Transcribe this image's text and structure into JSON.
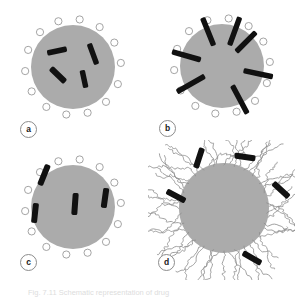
{
  "figure": {
    "type": "scientific-schematic",
    "layout": "2x2-grid",
    "width": 295,
    "height": 297,
    "background": "#ffffff",
    "caption": "Fig. 7.11   Schematic representation of drug",
    "caption_label": "Fig. 7.11",
    "colors": {
      "particle_fill": "#ababab",
      "particle_stroke": "none",
      "rod_fill": "#111111",
      "receptor_fill": "#ffffff",
      "receptor_stroke": "#9a9a9a",
      "polymer_stroke": "#8f8f8f",
      "label_text": "#1a1a1a",
      "label_border": "#8c8c8c"
    }
  },
  "panels": [
    {
      "id": "a",
      "label": "a",
      "name": "panel-a-drug-encapsulated",
      "description": "Spherical particle with surface receptor rings and drug rods randomly dispersed inside the core",
      "circle": {
        "cx": 73,
        "cy": 67,
        "r": 42
      },
      "receptor_count": 14,
      "receptor_radius": 3.6,
      "receptor_ring_radius": 48,
      "receptor_start_angle": -82,
      "rod_count": 4,
      "rods": [
        {
          "x": 57,
          "y": 51,
          "len": 20,
          "w": 5.5,
          "angle": -12
        },
        {
          "x": 93,
          "y": 54,
          "len": 22,
          "w": 5.5,
          "angle": 70
        },
        {
          "x": 58,
          "y": 75,
          "len": 20,
          "w": 6,
          "angle": 44
        },
        {
          "x": 84,
          "y": 79,
          "len": 18,
          "w": 5.5,
          "angle": 78
        }
      ]
    },
    {
      "id": "b",
      "label": "b",
      "name": "panel-b-drug-membrane-inserted",
      "description": "Particle with drug rods inserted radially through the surface, spanning the membrane boundary",
      "circle": {
        "cx": 222,
        "cy": 66,
        "r": 42
      },
      "receptor_count": 14,
      "receptor_radius": 3.6,
      "receptor_ring_radius": 48,
      "receptor_start_angle": -82,
      "rod_count": 7,
      "rods": [
        {
          "angle": 248,
          "inner": 22,
          "outer": 52,
          "w": 5.5
        },
        {
          "angle": 290,
          "inner": 22,
          "outer": 52,
          "w": 5.5
        },
        {
          "angle": 315,
          "inner": 20,
          "outer": 48,
          "w": 5.5
        },
        {
          "angle": 12,
          "inner": 22,
          "outer": 52,
          "w": 5.5
        },
        {
          "angle": 62,
          "inner": 22,
          "outer": 54,
          "w": 5.5
        },
        {
          "angle": 150,
          "inner": 20,
          "outer": 52,
          "w": 5.5
        },
        {
          "angle": 196,
          "inner": 22,
          "outer": 52,
          "w": 5.5
        }
      ]
    },
    {
      "id": "c",
      "label": "c",
      "name": "panel-c-drug-oriented-radial",
      "description": "Particle with fewer drug rods aligned near-vertically inside the core and one crossing the surface",
      "circle": {
        "cx": 73,
        "cy": 207,
        "r": 42
      },
      "receptor_count": 14,
      "receptor_radius": 3.6,
      "receptor_ring_radius": 48,
      "receptor_start_angle": -82,
      "rod_count": 4,
      "rods": [
        {
          "x": 44,
          "y": 175,
          "len": 22,
          "w": 6,
          "angle": 112
        },
        {
          "x": 35,
          "y": 213,
          "len": 20,
          "w": 6,
          "angle": 96
        },
        {
          "x": 75,
          "y": 204,
          "len": 22,
          "w": 6,
          "angle": 94
        },
        {
          "x": 105,
          "y": 198,
          "len": 20,
          "w": 6,
          "angle": 98
        }
      ]
    },
    {
      "id": "d",
      "label": "d",
      "name": "panel-d-pegylated-particle",
      "description": "Particle coated with a corona of wavy polymer chains, drug rods dispersed in the outer polymer layer",
      "circle": {
        "cx": 224,
        "cy": 208,
        "r": 45
      },
      "polymer_chain_count": 26,
      "polymer_length": 44,
      "rod_count": 5,
      "rods": [
        {
          "x": 199,
          "y": 158,
          "len": 21,
          "w": 6,
          "angle": 108
        },
        {
          "x": 245,
          "y": 157,
          "len": 21,
          "w": 6,
          "angle": 8
        },
        {
          "x": 281,
          "y": 190,
          "len": 21,
          "w": 6,
          "angle": 42
        },
        {
          "x": 176,
          "y": 196,
          "len": 21,
          "w": 6,
          "angle": 28
        },
        {
          "x": 252,
          "y": 258,
          "len": 21,
          "w": 6,
          "angle": 30
        }
      ]
    }
  ]
}
